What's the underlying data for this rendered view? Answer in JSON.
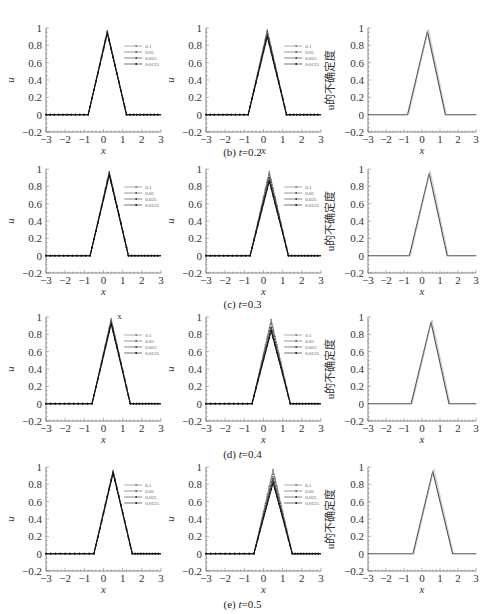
{
  "figure": {
    "rows": [
      {
        "caption_label": "(b)",
        "caption_var": "t",
        "caption_value": "=0.2",
        "top": 0,
        "caption_top": 150
      },
      {
        "caption_label": "(c)",
        "caption_var": "t",
        "caption_value": "=0.3",
        "top": 155,
        "caption_top": 300
      },
      {
        "caption_label": "(d)",
        "caption_var": "t",
        "caption_value": "=0.4",
        "top": 305,
        "caption_top": 450
      },
      {
        "caption_label": "(e)",
        "caption_var": "t",
        "caption_value": "=0.5",
        "top": 455,
        "caption_top": 598
      }
    ],
    "legend": [
      "0.1",
      "0.05",
      "0.025",
      "0.0125"
    ],
    "xlabel": "x",
    "ylabel_u": "u",
    "ylabel_uncertainty": "u的不确定度",
    "xticks": [
      "−3",
      "−2",
      "−1",
      "0",
      "1",
      "2",
      "3"
    ],
    "yticks": [
      "−0.2",
      "0",
      "0.2",
      "0.4",
      "0.6",
      "0.8",
      "1"
    ],
    "annotation_d_left": "x"
  },
  "chart_data": [
    {
      "type": "line",
      "panel": "b-left",
      "title": "(b) t=0.2",
      "xlabel": "x",
      "ylabel": "u",
      "xlim": [
        -3,
        3
      ],
      "ylim": [
        -0.2,
        1
      ],
      "legend": [
        "0.1",
        "0.05",
        "0.025",
        "0.0125"
      ],
      "series": [
        {
          "name": "0.1",
          "x": [
            -3,
            -0.8,
            0.2,
            1.2,
            3
          ],
          "y": [
            0,
            0,
            0.97,
            0,
            0
          ]
        },
        {
          "name": "0.05",
          "x": [
            -3,
            -0.8,
            0.2,
            1.2,
            3
          ],
          "y": [
            0,
            0,
            0.96,
            0,
            0
          ]
        },
        {
          "name": "0.025",
          "x": [
            -3,
            -0.8,
            0.2,
            1.2,
            3
          ],
          "y": [
            0,
            0,
            0.95,
            0,
            0
          ]
        },
        {
          "name": "0.0125",
          "x": [
            -3,
            -0.8,
            0.2,
            1.2,
            3
          ],
          "y": [
            0,
            0,
            0.94,
            0,
            0
          ]
        }
      ]
    },
    {
      "type": "line",
      "panel": "b-middle",
      "title": "(b) t=0.2",
      "xlabel": "x",
      "ylabel": "u",
      "xlim": [
        -3,
        3
      ],
      "ylim": [
        -0.2,
        1
      ],
      "legend": [
        "0.1",
        "0.05",
        "0.025",
        "0.0125"
      ],
      "series": [
        {
          "name": "0.1",
          "x": [
            -3,
            -0.8,
            0.2,
            1.2,
            3
          ],
          "y": [
            0,
            0,
            0.98,
            0,
            0
          ]
        },
        {
          "name": "0.05",
          "x": [
            -3,
            -0.8,
            0.2,
            1.2,
            3
          ],
          "y": [
            0,
            0,
            0.96,
            0,
            0
          ]
        },
        {
          "name": "0.025",
          "x": [
            -3,
            -0.8,
            0.2,
            1.2,
            3
          ],
          "y": [
            0,
            0,
            0.93,
            0,
            0
          ]
        },
        {
          "name": "0.0125",
          "x": [
            -3,
            -0.8,
            0.2,
            1.2,
            3
          ],
          "y": [
            0,
            0,
            0.9,
            0,
            0
          ]
        }
      ]
    },
    {
      "type": "line",
      "panel": "b-right",
      "title": "(b) t=0.2",
      "xlabel": "x",
      "ylabel": "u的不确定度",
      "xlim": [
        -3,
        3
      ],
      "ylim": [
        -0.2,
        1
      ],
      "series": [
        {
          "name": "uncertainty",
          "x": [
            -3,
            -0.8,
            0.3,
            1.3,
            3
          ],
          "y": [
            0,
            0,
            0.96,
            0,
            0
          ]
        }
      ]
    },
    {
      "type": "line",
      "panel": "c-left",
      "title": "(c) t=0.3",
      "xlabel": "x",
      "ylabel": "u",
      "xlim": [
        -3,
        3
      ],
      "ylim": [
        -0.2,
        1
      ],
      "legend": [
        "0.1",
        "0.05",
        "0.025",
        "0.0125"
      ],
      "series": [
        {
          "name": "0.1",
          "x": [
            -3,
            -0.7,
            0.3,
            1.3,
            3
          ],
          "y": [
            0,
            0,
            0.97,
            0,
            0
          ]
        },
        {
          "name": "0.05",
          "x": [
            -3,
            -0.7,
            0.3,
            1.3,
            3
          ],
          "y": [
            0,
            0,
            0.96,
            0,
            0
          ]
        },
        {
          "name": "0.025",
          "x": [
            -3,
            -0.7,
            0.3,
            1.3,
            3
          ],
          "y": [
            0,
            0,
            0.95,
            0,
            0
          ]
        },
        {
          "name": "0.0125",
          "x": [
            -3,
            -0.7,
            0.3,
            1.3,
            3
          ],
          "y": [
            0,
            0,
            0.93,
            0,
            0
          ]
        }
      ]
    },
    {
      "type": "line",
      "panel": "c-middle",
      "title": "(c) t=0.3",
      "xlabel": "x",
      "ylabel": "u",
      "xlim": [
        -3,
        3
      ],
      "ylim": [
        -0.2,
        1
      ],
      "legend": [
        "0.1",
        "0.05",
        "0.025",
        "0.0125"
      ],
      "series": [
        {
          "name": "0.1",
          "x": [
            -3,
            -0.7,
            0.3,
            1.3,
            3
          ],
          "y": [
            0,
            0,
            0.97,
            0,
            0
          ]
        },
        {
          "name": "0.05",
          "x": [
            -3,
            -0.7,
            0.3,
            1.3,
            3
          ],
          "y": [
            0,
            0,
            0.94,
            0,
            0
          ]
        },
        {
          "name": "0.025",
          "x": [
            -3,
            -0.7,
            0.3,
            1.3,
            3
          ],
          "y": [
            0,
            0,
            0.9,
            0,
            0
          ]
        },
        {
          "name": "0.0125",
          "x": [
            -3,
            -0.7,
            0.3,
            1.3,
            3
          ],
          "y": [
            0,
            0,
            0.86,
            0,
            0
          ]
        }
      ]
    },
    {
      "type": "line",
      "panel": "c-right",
      "title": "(c) t=0.3",
      "xlabel": "x",
      "ylabel": "u的不确定度",
      "xlim": [
        -3,
        3
      ],
      "ylim": [
        -0.2,
        1
      ],
      "series": [
        {
          "name": "uncertainty",
          "x": [
            -3,
            -0.7,
            0.4,
            1.4,
            3
          ],
          "y": [
            0,
            0,
            0.95,
            0,
            0
          ]
        }
      ]
    },
    {
      "type": "line",
      "panel": "d-left",
      "title": "(d) t=0.4",
      "xlabel": "x",
      "ylabel": "u",
      "xlim": [
        -3,
        3
      ],
      "ylim": [
        -0.2,
        1
      ],
      "legend": [
        "0.1",
        "0.05",
        "0.025",
        "0.0125"
      ],
      "annotations": [
        "x"
      ],
      "series": [
        {
          "name": "0.1",
          "x": [
            -3,
            -0.6,
            0.4,
            1.4,
            3
          ],
          "y": [
            0,
            0,
            0.98,
            0,
            0
          ]
        },
        {
          "name": "0.05",
          "x": [
            -3,
            -0.6,
            0.4,
            1.4,
            3
          ],
          "y": [
            0,
            0,
            0.96,
            0,
            0
          ]
        },
        {
          "name": "0.025",
          "x": [
            -3,
            -0.6,
            0.4,
            1.4,
            3
          ],
          "y": [
            0,
            0,
            0.94,
            0,
            0
          ]
        },
        {
          "name": "0.0125",
          "x": [
            -3,
            -0.6,
            0.4,
            1.4,
            3
          ],
          "y": [
            0,
            0,
            0.92,
            0,
            0
          ]
        }
      ]
    },
    {
      "type": "line",
      "panel": "d-middle",
      "title": "(d) t=0.4",
      "xlabel": "x",
      "ylabel": "u",
      "xlim": [
        -3,
        3
      ],
      "ylim": [
        -0.2,
        1
      ],
      "legend": [
        "0.1",
        "0.05",
        "0.025",
        "0.0125"
      ],
      "series": [
        {
          "name": "0.1",
          "x": [
            -3,
            -0.6,
            0.4,
            1.4,
            3
          ],
          "y": [
            0,
            0,
            0.97,
            0,
            0
          ]
        },
        {
          "name": "0.05",
          "x": [
            -3,
            -0.6,
            0.4,
            1.4,
            3
          ],
          "y": [
            0,
            0,
            0.93,
            0,
            0
          ]
        },
        {
          "name": "0.025",
          "x": [
            -3,
            -0.6,
            0.4,
            1.4,
            3
          ],
          "y": [
            0,
            0,
            0.88,
            0,
            0
          ]
        },
        {
          "name": "0.0125",
          "x": [
            -3,
            -0.6,
            0.4,
            1.4,
            3
          ],
          "y": [
            0,
            0,
            0.84,
            0,
            0
          ]
        }
      ]
    },
    {
      "type": "line",
      "panel": "d-right",
      "title": "(d) t=0.4",
      "xlabel": "x",
      "ylabel": "u的不确定度",
      "xlim": [
        -3,
        3
      ],
      "ylim": [
        -0.2,
        1
      ],
      "series": [
        {
          "name": "uncertainty",
          "x": [
            -3,
            -0.6,
            0.5,
            1.5,
            3
          ],
          "y": [
            0,
            0,
            0.94,
            0,
            0
          ]
        }
      ]
    },
    {
      "type": "line",
      "panel": "e-left",
      "title": "(e) t=0.5",
      "xlabel": "x",
      "ylabel": "u",
      "xlim": [
        -3,
        3
      ],
      "ylim": [
        -0.2,
        1
      ],
      "legend": [
        "0.1",
        "0.05",
        "0.025",
        "0.0125"
      ],
      "series": [
        {
          "name": "0.1",
          "x": [
            -3,
            -0.5,
            0.5,
            1.5,
            3
          ],
          "y": [
            0,
            0,
            0.96,
            0,
            0
          ]
        },
        {
          "name": "0.05",
          "x": [
            -3,
            -0.5,
            0.5,
            1.5,
            3
          ],
          "y": [
            0,
            0,
            0.95,
            0,
            0
          ]
        },
        {
          "name": "0.025",
          "x": [
            -3,
            -0.5,
            0.5,
            1.5,
            3
          ],
          "y": [
            0,
            0,
            0.94,
            0,
            0
          ]
        },
        {
          "name": "0.0125",
          "x": [
            -3,
            -0.5,
            0.5,
            1.5,
            3
          ],
          "y": [
            0,
            0,
            0.93,
            0,
            0
          ]
        }
      ]
    },
    {
      "type": "line",
      "panel": "e-middle",
      "title": "(e) t=0.5",
      "xlabel": "x",
      "ylabel": "u",
      "xlim": [
        -3,
        3
      ],
      "ylim": [
        -0.2,
        1
      ],
      "legend": [
        "0.1",
        "0.05",
        "0.025",
        "0.0125"
      ],
      "series": [
        {
          "name": "0.1",
          "x": [
            -3,
            -0.5,
            0.5,
            1.5,
            3
          ],
          "y": [
            0,
            0,
            0.97,
            0,
            0
          ]
        },
        {
          "name": "0.05",
          "x": [
            -3,
            -0.5,
            0.5,
            1.5,
            3
          ],
          "y": [
            0,
            0,
            0.92,
            0,
            0
          ]
        },
        {
          "name": "0.025",
          "x": [
            -3,
            -0.5,
            0.5,
            1.5,
            3
          ],
          "y": [
            0,
            0,
            0.87,
            0,
            0
          ]
        },
        {
          "name": "0.0125",
          "x": [
            -3,
            -0.5,
            0.5,
            1.5,
            3
          ],
          "y": [
            0,
            0,
            0.82,
            0,
            0
          ]
        }
      ]
    },
    {
      "type": "line",
      "panel": "e-right",
      "title": "(e) t=0.5",
      "xlabel": "x",
      "ylabel": "u的不确定度",
      "xlim": [
        -3,
        3
      ],
      "ylim": [
        -0.2,
        1
      ],
      "series": [
        {
          "name": "uncertainty",
          "x": [
            -3,
            -0.5,
            0.6,
            1.7,
            3
          ],
          "y": [
            0,
            0,
            0.95,
            0,
            0
          ]
        }
      ]
    }
  ]
}
